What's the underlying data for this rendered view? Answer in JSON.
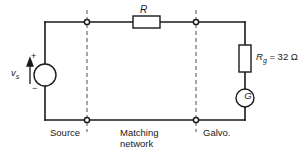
{
  "diagram": {
    "type": "electrical-circuit-schematic",
    "components": {
      "source": {
        "symbol": "circle",
        "label": "v",
        "label_subscript": "s",
        "polarity_plus": "+",
        "polarity_minus": "−",
        "kind": "voltage-source"
      },
      "series_resistor": {
        "symbol": "rectangle",
        "label": "R",
        "kind": "resistor"
      },
      "galvo_resistor": {
        "symbol": "rectangle",
        "label": "R",
        "label_subscript": "g",
        "value_text": "= 32 Ω",
        "resistance": 32,
        "unit": "Ω",
        "kind": "resistor"
      },
      "galvanometer": {
        "symbol": "circle",
        "label": "G",
        "kind": "galvanometer"
      }
    },
    "sections": [
      {
        "name": "source",
        "caption": "Source"
      },
      {
        "name": "matching-network",
        "caption_line1": "Matching",
        "caption_line2": "network"
      },
      {
        "name": "galvanometer",
        "caption": "Galvo."
      }
    ],
    "nodes": [
      {
        "name": "top-left-boundary-node"
      },
      {
        "name": "top-right-boundary-node"
      },
      {
        "name": "bottom-left-boundary-node"
      },
      {
        "name": "bottom-right-boundary-node"
      }
    ],
    "colors": {
      "wire": "#1a1a1a",
      "divider": "#6d6d6d",
      "background": "#ffffff"
    }
  }
}
